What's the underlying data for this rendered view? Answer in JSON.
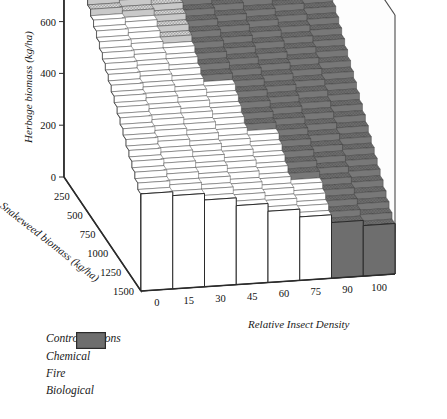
{
  "chart_data": {
    "type": "surface3d",
    "title": "",
    "xlabel": "Relative Insect Density",
    "ylabel": "Snakeweed biomass (kg/ha)",
    "zlabel": "Herbage biomass (kg/ha)",
    "x_ticks": [
      "0",
      "15",
      "30",
      "45",
      "60",
      "75",
      "90",
      "100"
    ],
    "y_ticks": [
      "250",
      "500",
      "750",
      "1000",
      "1250",
      "1500"
    ],
    "z_ticks": [
      "0",
      "200",
      "400",
      "600",
      "800",
      "1,000"
    ],
    "xlim": [
      0,
      100
    ],
    "ylim": [
      250,
      1500
    ],
    "zlim": [
      0,
      1000
    ],
    "grid": true,
    "legend_position": "below-left",
    "categories_x": [
      0,
      15,
      30,
      45,
      60,
      75,
      90,
      100
    ],
    "rows_y": [
      250,
      300,
      350,
      400,
      450,
      500,
      550,
      600,
      650,
      700,
      750,
      800,
      850,
      900,
      950,
      1000,
      1050,
      1100,
      1150,
      1200,
      1250,
      1300,
      1350,
      1400,
      1450,
      1500
    ],
    "surface_note": "Herbage biomass declines with increasing insect density and increasing snakeweed biomass; cell fill encodes the optimal control option.",
    "z_surface": [
      [
        1000,
        985,
        960,
        930,
        900,
        870,
        840,
        820
      ],
      [
        975,
        960,
        935,
        905,
        875,
        845,
        815,
        795
      ],
      [
        950,
        935,
        910,
        880,
        850,
        820,
        790,
        770
      ],
      [
        925,
        910,
        885,
        855,
        825,
        795,
        765,
        745
      ],
      [
        900,
        885,
        860,
        830,
        800,
        770,
        740,
        720
      ],
      [
        875,
        860,
        835,
        805,
        775,
        745,
        715,
        695
      ],
      [
        850,
        835,
        810,
        780,
        750,
        720,
        690,
        670
      ],
      [
        825,
        810,
        785,
        755,
        725,
        695,
        665,
        645
      ],
      [
        800,
        785,
        760,
        730,
        700,
        670,
        640,
        620
      ],
      [
        775,
        760,
        735,
        705,
        675,
        645,
        615,
        595
      ],
      [
        750,
        735,
        710,
        680,
        650,
        620,
        590,
        570
      ],
      [
        725,
        710,
        685,
        655,
        625,
        595,
        565,
        545
      ],
      [
        700,
        685,
        660,
        630,
        600,
        570,
        540,
        520
      ],
      [
        675,
        660,
        635,
        605,
        575,
        545,
        515,
        495
      ],
      [
        650,
        635,
        610,
        580,
        550,
        520,
        490,
        470
      ],
      [
        625,
        610,
        585,
        555,
        525,
        495,
        465,
        445
      ],
      [
        600,
        585,
        560,
        530,
        500,
        470,
        440,
        420
      ],
      [
        575,
        560,
        535,
        505,
        475,
        445,
        415,
        395
      ],
      [
        550,
        535,
        510,
        480,
        450,
        420,
        390,
        370
      ],
      [
        525,
        510,
        485,
        455,
        425,
        395,
        365,
        345
      ],
      [
        500,
        485,
        460,
        430,
        400,
        370,
        340,
        320
      ],
      [
        475,
        460,
        435,
        405,
        375,
        345,
        315,
        295
      ],
      [
        450,
        435,
        410,
        380,
        350,
        320,
        290,
        270
      ],
      [
        425,
        410,
        385,
        355,
        325,
        295,
        265,
        245
      ],
      [
        400,
        385,
        360,
        330,
        300,
        270,
        240,
        220
      ],
      [
        375,
        360,
        335,
        305,
        275,
        245,
        215,
        195
      ]
    ],
    "control_surface": [
      [
        "Fire",
        "Biological",
        "Biological",
        "Biological",
        "Biological",
        "Biological",
        "Biological",
        "Biological"
      ],
      [
        "Fire",
        "Biological",
        "Biological",
        "Biological",
        "Biological",
        "Biological",
        "Biological",
        "Biological"
      ],
      [
        "Fire",
        "Fire",
        "Biological",
        "Biological",
        "Biological",
        "Biological",
        "Biological",
        "Biological"
      ],
      [
        "Fire",
        "Fire",
        "Biological",
        "Biological",
        "Biological",
        "Biological",
        "Biological",
        "Biological"
      ],
      [
        "Fire",
        "Fire",
        "Fire",
        "Biological",
        "Biological",
        "Biological",
        "Biological",
        "Biological"
      ],
      [
        "Fire",
        "Fire",
        "Fire",
        "Biological",
        "Biological",
        "Biological",
        "Biological",
        "Biological"
      ],
      [
        "Fire",
        "Fire",
        "Fire",
        "Biological",
        "Biological",
        "Biological",
        "Biological",
        "Biological"
      ],
      [
        "Fire",
        "Fire",
        "Fire",
        "Biological",
        "Biological",
        "Biological",
        "Biological",
        "Biological"
      ],
      [
        "Fire",
        "Fire",
        "Fire",
        "Biological",
        "Biological",
        "Biological",
        "Biological",
        "Biological"
      ],
      [
        "Chemical",
        "Chemical",
        "Fire",
        "Biological",
        "Biological",
        "Biological",
        "Biological",
        "Biological"
      ],
      [
        "Chemical",
        "Chemical",
        "Fire",
        "Biological",
        "Biological",
        "Biological",
        "Biological",
        "Biological"
      ],
      [
        "Chemical",
        "Chemical",
        "Chemical",
        "Biological",
        "Biological",
        "Biological",
        "Biological",
        "Biological"
      ],
      [
        "Chemical",
        "Chemical",
        "Chemical",
        "Biological",
        "Biological",
        "Biological",
        "Biological",
        "Biological"
      ],
      [
        "Chemical",
        "Chemical",
        "Chemical",
        "Biological",
        "Biological",
        "Biological",
        "Biological",
        "Biological"
      ],
      [
        "Chemical",
        "Chemical",
        "Chemical",
        "Chemical",
        "Biological",
        "Biological",
        "Biological",
        "Biological"
      ],
      [
        "Chemical",
        "Chemical",
        "Chemical",
        "Chemical",
        "Biological",
        "Biological",
        "Biological",
        "Biological"
      ],
      [
        "Chemical",
        "Chemical",
        "Chemical",
        "Chemical",
        "Biological",
        "Biological",
        "Biological",
        "Biological"
      ],
      [
        "Chemical",
        "Chemical",
        "Chemical",
        "Chemical",
        "Biological",
        "Biological",
        "Biological",
        "Biological"
      ],
      [
        "Chemical",
        "Chemical",
        "Chemical",
        "Chemical",
        "Chemical",
        "Biological",
        "Biological",
        "Biological"
      ],
      [
        "Chemical",
        "Chemical",
        "Chemical",
        "Chemical",
        "Chemical",
        "Biological",
        "Biological",
        "Biological"
      ],
      [
        "Chemical",
        "Chemical",
        "Chemical",
        "Chemical",
        "Chemical",
        "Biological",
        "Biological",
        "Biological"
      ],
      [
        "Chemical",
        "Chemical",
        "Chemical",
        "Chemical",
        "Chemical",
        "Biological",
        "Biological",
        "Biological"
      ],
      [
        "Chemical",
        "Chemical",
        "Chemical",
        "Chemical",
        "Chemical",
        "Chemical",
        "Biological",
        "Biological"
      ],
      [
        "Chemical",
        "Chemical",
        "Chemical",
        "Chemical",
        "Chemical",
        "Chemical",
        "Biological",
        "Biological"
      ],
      [
        "Chemical",
        "Chemical",
        "Chemical",
        "Chemical",
        "Chemical",
        "Chemical",
        "Biological",
        "Biological"
      ],
      [
        "Chemical",
        "Chemical",
        "Chemical",
        "Chemical",
        "Chemical",
        "Chemical",
        "Biological",
        "Biological"
      ]
    ]
  },
  "legend": {
    "title": "Control Options",
    "items": [
      {
        "label": "Chemical",
        "color": "#ffffff",
        "pattern": "solid"
      },
      {
        "label": "Fire",
        "color": "#c4c4c4",
        "pattern": "stipple"
      },
      {
        "label": "Biological",
        "color": "#6e6e6e",
        "pattern": "solid"
      }
    ]
  },
  "colors": {
    "chemical": "#ffffff",
    "fire": "#c4c4c4",
    "biological": "#6e6e6e",
    "cell_edge": "#3a3a3a",
    "axis": "#2b2b2b",
    "frame": "#4a4a4a",
    "text": "#111111"
  }
}
